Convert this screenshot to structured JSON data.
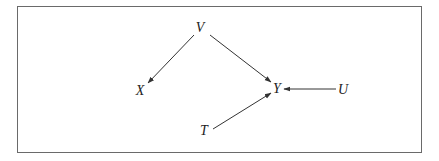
{
  "diagram": {
    "type": "directed-graph",
    "nodes": [
      {
        "id": "V",
        "label": "V",
        "x": 200,
        "y": 32
      },
      {
        "id": "X",
        "label": "X",
        "x": 140,
        "y": 95
      },
      {
        "id": "Y",
        "label": "Y",
        "x": 277,
        "y": 93
      },
      {
        "id": "U",
        "label": "U",
        "x": 343,
        "y": 94
      },
      {
        "id": "T",
        "label": "T",
        "x": 204,
        "y": 135
      }
    ],
    "edges": [
      {
        "from": "V",
        "to": "X"
      },
      {
        "from": "V",
        "to": "Y"
      },
      {
        "from": "U",
        "to": "Y"
      },
      {
        "from": "T",
        "to": "Y"
      }
    ],
    "colors": {
      "stroke": "#333333",
      "frame": "#6a6a6a",
      "text": "#222222"
    }
  }
}
